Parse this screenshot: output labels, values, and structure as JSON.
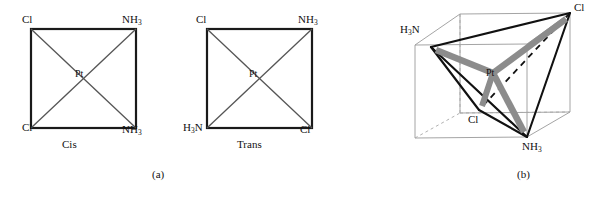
{
  "figure": {
    "panels": [
      {
        "id": "panel-a",
        "caption": "(a)",
        "caption_x": 152,
        "caption_y": 168,
        "structures": [
          {
            "id": "cis",
            "name": "Cis",
            "caption": "Cis",
            "caption_x": 62,
            "caption_y": 138,
            "center_atom": "Pt",
            "center_x": 83,
            "center_y": 74,
            "square": {
              "x1": 31,
              "y1": 29,
              "x2": 136,
              "y2": 128
            },
            "corner_labels": [
              {
                "text": "Cl",
                "sub": "",
                "x": 22,
                "y": 14,
                "corner": "top-left"
              },
              {
                "text": "NH",
                "sub": "3",
                "x": 122,
                "y": 14,
                "corner": "top-right"
              },
              {
                "text": "Cl",
                "sub": "",
                "x": 22,
                "y": 122,
                "corner": "bottom-left"
              },
              {
                "text": "NH",
                "sub": "3",
                "x": 122,
                "y": 124,
                "corner": "bottom-right"
              }
            ]
          },
          {
            "id": "trans",
            "name": "Trans",
            "caption": "Trans",
            "caption_x": 237,
            "caption_y": 138,
            "center_atom": "Pt",
            "center_x": 257,
            "center_y": 74,
            "square": {
              "x1": 207,
              "y1": 29,
              "x2": 312,
              "y2": 128
            },
            "corner_labels": [
              {
                "text": "Cl",
                "sub": "",
                "x": 196,
                "y": 14,
                "corner": "top-left"
              },
              {
                "text": "NH",
                "sub": "3",
                "x": 298,
                "y": 14,
                "corner": "top-right"
              },
              {
                "text": "H",
                "sub": "3",
                "suffix": "N",
                "x": 183,
                "y": 122,
                "corner": "bottom-left"
              },
              {
                "text": "Cl",
                "sub": "",
                "x": 300,
                "y": 124,
                "corner": "bottom-right"
              }
            ]
          }
        ]
      },
      {
        "id": "panel-b",
        "caption": "(b)",
        "caption_x": 127,
        "caption_y": 168,
        "structure": {
          "id": "tetrahedral",
          "center_atom": "Pt",
          "center_x": 103,
          "center_y": 73,
          "cube": {
            "front_bottom_left": {
              "x": 25,
              "y": 138
            },
            "front_bottom_right": {
              "x": 137,
              "y": 137
            },
            "front_top_left": {
              "x": 25,
              "y": 45
            },
            "front_top_right": {
              "x": 137,
              "y": 44
            },
            "back_bottom_left": {
              "x": 70,
              "y": 113
            },
            "back_bottom_right": {
              "x": 180,
              "y": 112
            },
            "back_top_left": {
              "x": 70,
              "y": 14
            },
            "back_top_right": {
              "x": 180,
              "y": 13
            }
          },
          "vertices": [
            {
              "atom": "H3N",
              "text": "H",
              "sub": "3",
              "suffix": "N",
              "x": 41,
              "y": 47,
              "label_x": 10,
              "label_y": 24
            },
            {
              "atom": "Cl",
              "text": "Cl",
              "sub": "",
              "x": 180,
              "y": 13,
              "label_x": 184,
              "label_y": 2
            },
            {
              "atom": "Cl",
              "text": "Cl",
              "sub": "",
              "x": 89,
              "y": 110,
              "label_x": 78,
              "label_y": 114
            },
            {
              "atom": "NH3",
              "text": "NH",
              "sub": "3",
              "x": 137,
              "y": 137,
              "label_x": 132,
              "label_y": 141
            }
          ],
          "bond_style_note": "grey-wedge-bonds-from-center"
        }
      }
    ]
  },
  "colors": {
    "line_black": "#1a1a1a",
    "line_thin": "#555555",
    "cube_grey": "#9a9a9a",
    "bond_grey": "#8c8c8c",
    "background": "#ffffff"
  }
}
